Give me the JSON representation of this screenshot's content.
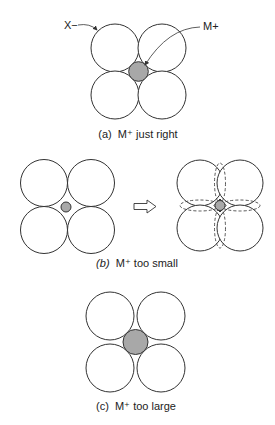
{
  "figure": {
    "colors": {
      "anion_fill": "#ffffff",
      "cation_fill": "#a8a8a8",
      "stroke": "#333333"
    },
    "labels": {
      "anion": "X−",
      "cation": "M+"
    },
    "panels": [
      {
        "id": "a",
        "caption_prefix": "(a)",
        "caption_text": "M⁺ just right"
      },
      {
        "id": "b",
        "caption_prefix": "(b)",
        "caption_text": "M⁺ too small",
        "transition_arrow": "open-right-arrow"
      },
      {
        "id": "c",
        "caption_prefix": "(c)",
        "caption_text": "M⁺ too large"
      }
    ]
  }
}
